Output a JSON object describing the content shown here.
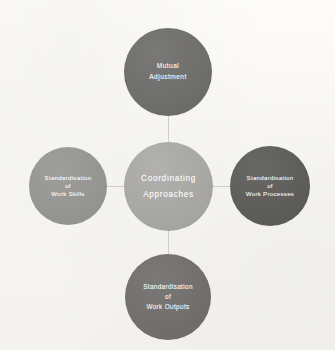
{
  "diagram": {
    "type": "radial-hub-and-spoke",
    "background_color": "#fbfaf8",
    "connector_color": "#cfcdc9",
    "text_color": "#ffffff",
    "center": {
      "id": "coordinating-approaches",
      "lines": [
        "Coordinating",
        "Approaches"
      ],
      "color": "#a9a8a5"
    },
    "nodes": [
      {
        "id": "mutual-adjustment",
        "position": "top",
        "lines": [
          "Mutual",
          "Adjustment"
        ],
        "color": "#6f6e6c"
      },
      {
        "id": "standardisation-of-work-skills",
        "position": "left",
        "lines": [
          "Standardisation",
          "of",
          "Work Skills"
        ],
        "color": "#979693"
      },
      {
        "id": "standardisation-of-work-processes",
        "position": "right",
        "lines": [
          "Standardisation",
          "of",
          "Work Processes"
        ],
        "color": "#5d5c5a"
      },
      {
        "id": "standardisation-of-work-outputs",
        "position": "bottom",
        "lines": [
          "Standardisation",
          "of",
          "Work Outputs"
        ],
        "color": "#716f6d"
      }
    ]
  }
}
